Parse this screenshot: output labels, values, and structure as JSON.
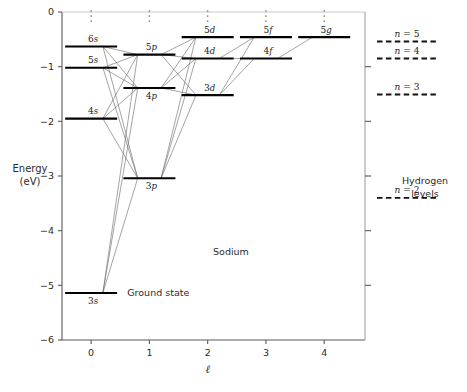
{
  "figure": {
    "element_label": "Sodium",
    "ground_state_label": "Ground state",
    "hydrogen_caption_line1": "Hydrogen",
    "hydrogen_caption_line2": "levels"
  },
  "chart_data": {
    "type": "scatter",
    "title": "",
    "xlabel": "ℓ",
    "ylabel_line1": "Energy",
    "ylabel_line2": "(eV)",
    "xlim": [
      -0.5,
      4.7
    ],
    "ylim": [
      -6,
      0
    ],
    "xticks": [
      0,
      1,
      2,
      3,
      4
    ],
    "xticklabels": [
      "0",
      "1",
      "2",
      "3",
      "4"
    ],
    "yticks": [
      0,
      -1,
      -2,
      -3,
      -4,
      -5,
      -6
    ],
    "yticklabels": [
      "0",
      "−1",
      "−2",
      "−3",
      "−4",
      "−5",
      "−6"
    ],
    "grid": false,
    "legend": "none",
    "series": [
      {
        "name": "Sodium energy levels",
        "points": [
          {
            "label": "3s",
            "l": 0,
            "energy": -5.14,
            "label_pos": "below"
          },
          {
            "label": "4s",
            "l": 0,
            "energy": -1.95,
            "label_pos": "above"
          },
          {
            "label": "5s",
            "l": 0,
            "energy": -1.02,
            "label_pos": "above"
          },
          {
            "label": "6s",
            "l": 0,
            "energy": -0.63,
            "label_pos": "above"
          },
          {
            "label": "3p",
            "l": 1,
            "energy": -3.04,
            "label_pos": "below"
          },
          {
            "label": "4p",
            "l": 1,
            "energy": -1.39,
            "label_pos": "below"
          },
          {
            "label": "5p",
            "l": 1,
            "energy": -0.78,
            "label_pos": "above"
          },
          {
            "label": "3d",
            "l": 2,
            "energy": -1.52,
            "label_pos": "above"
          },
          {
            "label": "4d",
            "l": 2,
            "energy": -0.85,
            "label_pos": "above"
          },
          {
            "label": "5d",
            "l": 2,
            "energy": -0.46,
            "label_pos": "above"
          },
          {
            "label": "4f",
            "l": 3,
            "energy": -0.85,
            "label_pos": "above"
          },
          {
            "label": "5f",
            "l": 3,
            "energy": -0.46,
            "label_pos": "above"
          },
          {
            "label": "5g",
            "l": 4,
            "energy": -0.46,
            "label_pos": "above"
          }
        ]
      },
      {
        "name": "Hydrogen levels",
        "points": [
          {
            "label": "n = 5",
            "energy": -0.54
          },
          {
            "label": "n = 4",
            "energy": -0.85
          },
          {
            "label": "n = 3",
            "energy": -1.51
          },
          {
            "label": "n = 2",
            "energy": -3.4
          }
        ]
      }
    ],
    "transitions": [
      {
        "from": "3s",
        "to": "3p"
      },
      {
        "from": "3s",
        "to": "4p"
      },
      {
        "from": "3s",
        "to": "5p"
      },
      {
        "from": "4s",
        "to": "3p"
      },
      {
        "from": "4s",
        "to": "4p"
      },
      {
        "from": "4s",
        "to": "5p"
      },
      {
        "from": "5s",
        "to": "3p"
      },
      {
        "from": "5s",
        "to": "4p"
      },
      {
        "from": "5s",
        "to": "5p"
      },
      {
        "from": "6s",
        "to": "3p"
      },
      {
        "from": "6s",
        "to": "4p"
      },
      {
        "from": "6s",
        "to": "5p"
      },
      {
        "from": "3p",
        "to": "3d"
      },
      {
        "from": "3p",
        "to": "4d"
      },
      {
        "from": "3p",
        "to": "5d"
      },
      {
        "from": "4p",
        "to": "3d"
      },
      {
        "from": "4p",
        "to": "4d"
      },
      {
        "from": "4p",
        "to": "5d"
      },
      {
        "from": "5p",
        "to": "3d"
      },
      {
        "from": "5p",
        "to": "4d"
      },
      {
        "from": "5p",
        "to": "5d"
      },
      {
        "from": "3d",
        "to": "4f"
      },
      {
        "from": "3d",
        "to": "5f"
      },
      {
        "from": "4d",
        "to": "4f"
      },
      {
        "from": "4d",
        "to": "5f"
      },
      {
        "from": "4f",
        "to": "5g"
      }
    ],
    "ellipsis_columns": [
      0,
      1,
      2,
      3,
      4
    ],
    "annotations": [
      {
        "text": "Sodium",
        "l": 2.4,
        "energy": -4.45
      },
      {
        "text": "Ground state",
        "l": 0.62,
        "energy": -5.14
      }
    ]
  }
}
